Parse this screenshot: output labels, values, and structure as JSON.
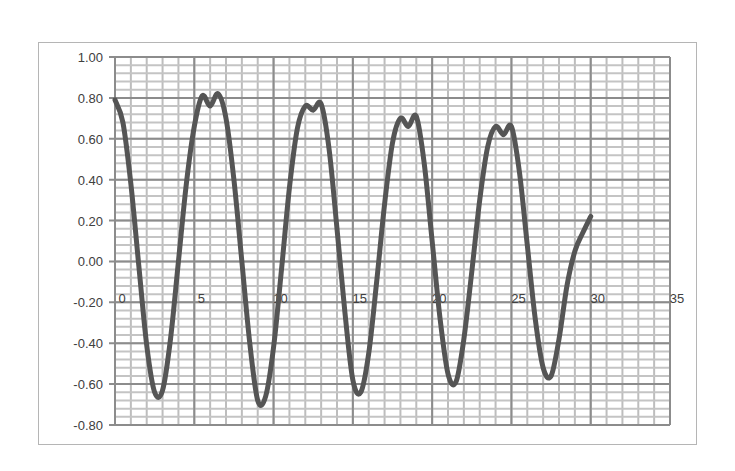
{
  "chart_data": {
    "type": "line",
    "title": "",
    "xlabel": "",
    "ylabel": "",
    "xlim": [
      0,
      35
    ],
    "ylim": [
      -0.8,
      1.0
    ],
    "x_ticks": [
      0,
      5,
      10,
      15,
      20,
      25,
      30,
      35
    ],
    "x_tick_labels": [
      "0",
      "5",
      "10",
      "15",
      "20",
      "25",
      "30",
      "35"
    ],
    "y_ticks": [
      1.0,
      0.8,
      0.6,
      0.4,
      0.2,
      0.0,
      -0.2,
      -0.4,
      -0.6,
      -0.8
    ],
    "y_tick_labels": [
      "1.00",
      "0.80",
      "0.60",
      "0.40",
      "0.20",
      "0.00",
      "-0.20",
      "-0.40",
      "-0.60",
      "-0.80"
    ],
    "grid": {
      "major": true,
      "minor": true,
      "x_minor_step": 1,
      "y_minor_step": 0.04
    },
    "legend": null,
    "series": [
      {
        "name": "Series1",
        "color": "#555555",
        "x": [
          0,
          0.5,
          1,
          1.5,
          2,
          2.5,
          3,
          3.5,
          4,
          4.5,
          5,
          5.5,
          6,
          6.5,
          7,
          7.5,
          8,
          8.5,
          9,
          9.5,
          10,
          10.5,
          11,
          11.5,
          12,
          12.5,
          13,
          13.5,
          14,
          14.5,
          15,
          15.5,
          16,
          16.5,
          17,
          17.5,
          18,
          18.5,
          19,
          19.5,
          20,
          20.5,
          21,
          21.5,
          22,
          22.5,
          23,
          23.5,
          24,
          24.5,
          25,
          25.5,
          26,
          26.5,
          27,
          27.5,
          28,
          28.5,
          29,
          29.5,
          30
        ],
        "values": [
          0.79,
          0.68,
          0.38,
          -0.02,
          -0.41,
          -0.64,
          -0.63,
          -0.38,
          0.0,
          0.38,
          0.66,
          0.81,
          0.76,
          0.82,
          0.7,
          0.4,
          0.0,
          -0.4,
          -0.68,
          -0.66,
          -0.42,
          -0.04,
          0.36,
          0.65,
          0.76,
          0.74,
          0.77,
          0.55,
          0.16,
          -0.25,
          -0.58,
          -0.64,
          -0.45,
          -0.1,
          0.28,
          0.58,
          0.7,
          0.66,
          0.71,
          0.48,
          0.1,
          -0.28,
          -0.55,
          -0.59,
          -0.38,
          -0.05,
          0.3,
          0.56,
          0.66,
          0.62,
          0.66,
          0.44,
          0.08,
          -0.28,
          -0.52,
          -0.56,
          -0.38,
          -0.12,
          0.05,
          0.14,
          0.22
        ]
      }
    ]
  }
}
